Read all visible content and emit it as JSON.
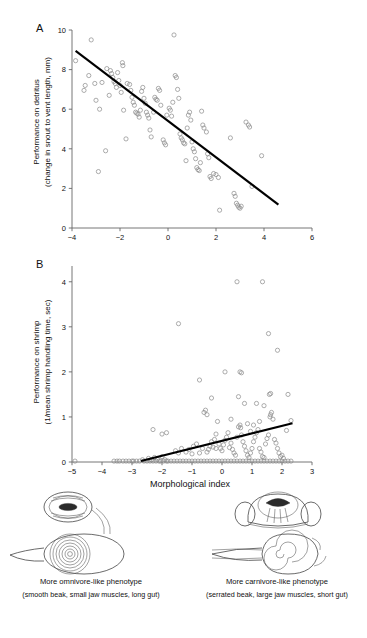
{
  "figure": {
    "panels": [
      {
        "id": "A",
        "label": "A",
        "ylabel_line1": "Performance on detritus",
        "ylabel_line2": "(change in snout to vent length, mm)"
      },
      {
        "id": "B",
        "label": "B",
        "ylabel_line1": "Performance on shrimp",
        "ylabel_line2": "(1/mean shrimp handling time, sec)",
        "xlabel": "Morphological index"
      }
    ],
    "morphs": [
      {
        "name": "omnivore",
        "caption_main": "More omnivore-like phenotype",
        "caption_sub": "(smooth beak, small jaw muscles, long gut)"
      },
      {
        "name": "carnivore",
        "caption_main": "More carnivore-like phenotype",
        "caption_sub": "(serrated beak, large jaw muscles, short gut)"
      }
    ]
  },
  "chart_data": [
    {
      "type": "scatter",
      "panel": "A",
      "title": "",
      "xlabel": "",
      "ylabel": "Performance on detritus (change in snout to vent length, mm)",
      "xlim": [
        -4,
        6
      ],
      "ylim": [
        0,
        10
      ],
      "xticks": [
        -4,
        -2,
        0,
        2,
        4,
        6
      ],
      "yticks": [
        0,
        2,
        4,
        6,
        8,
        10
      ],
      "xticklabels": [
        "−4",
        "−2",
        "0",
        "2",
        "4",
        "6"
      ],
      "yticklabels": [
        "0",
        "2",
        "4",
        "6",
        "8",
        "10"
      ],
      "grid": false,
      "legend": "none",
      "marker": "open-circle",
      "marker_color": "#8a8a8a",
      "trendline": {
        "type": "linear",
        "color": "#000000",
        "x": [
          -3.85,
          4.6
        ],
        "y": [
          8.95,
          1.18
        ]
      },
      "points": [
        [
          -3.85,
          8.45
        ],
        [
          -3.2,
          9.5
        ],
        [
          -3.3,
          7.7
        ],
        [
          -3.45,
          7.2
        ],
        [
          -3.05,
          7.3
        ],
        [
          -3.0,
          6.45
        ],
        [
          -3.5,
          6.95
        ],
        [
          -2.55,
          8.05
        ],
        [
          -2.4,
          7.95
        ],
        [
          -2.35,
          7.8
        ],
        [
          -2.3,
          7.6
        ],
        [
          -2.25,
          7.4
        ],
        [
          -2.2,
          7.3
        ],
        [
          -2.15,
          7.1
        ],
        [
          -2.1,
          7.85
        ],
        [
          -2.05,
          7.45
        ],
        [
          -2.0,
          7.2
        ],
        [
          -1.95,
          6.85
        ],
        [
          -1.9,
          8.35
        ],
        [
          -1.88,
          8.2
        ],
        [
          -1.7,
          7.3
        ],
        [
          -1.6,
          7.25
        ],
        [
          -1.55,
          6.95
        ],
        [
          -1.5,
          6.6
        ],
        [
          -1.45,
          6.35
        ],
        [
          -1.4,
          6.2
        ],
        [
          -1.35,
          5.85
        ],
        [
          -1.3,
          5.8
        ],
        [
          -1.25,
          5.75
        ],
        [
          -1.2,
          5.6
        ],
        [
          -1.15,
          5.95
        ],
        [
          -1.1,
          6.9
        ],
        [
          -1.05,
          7.1
        ],
        [
          -1.0,
          6.55
        ],
        [
          -0.95,
          6.3
        ],
        [
          -0.9,
          5.85
        ],
        [
          -0.85,
          5.7
        ],
        [
          -0.8,
          5.55
        ],
        [
          -0.75,
          4.95
        ],
        [
          -0.7,
          4.6
        ],
        [
          -0.6,
          5.85
        ],
        [
          -0.55,
          6.6
        ],
        [
          -0.5,
          6.5
        ],
        [
          -0.45,
          6.45
        ],
        [
          -0.4,
          7.05
        ],
        [
          -0.35,
          6.95
        ],
        [
          -0.3,
          6.2
        ],
        [
          -0.2,
          4.45
        ],
        [
          -0.15,
          4.3
        ],
        [
          -0.1,
          4.2
        ],
        [
          -2.85,
          6.0
        ],
        [
          -2.6,
          3.9
        ],
        [
          -2.9,
          2.85
        ],
        [
          -1.85,
          5.95
        ],
        [
          -1.75,
          4.5
        ],
        [
          0.05,
          6.05
        ],
        [
          0.1,
          5.95
        ],
        [
          0.15,
          5.65
        ],
        [
          0.2,
          6.35
        ],
        [
          0.3,
          7.7
        ],
        [
          0.35,
          7.6
        ],
        [
          0.4,
          7.0
        ],
        [
          0.45,
          6.55
        ],
        [
          0.5,
          4.75
        ],
        [
          0.55,
          4.55
        ],
        [
          0.6,
          4.45
        ],
        [
          0.65,
          4.3
        ],
        [
          0.7,
          4.25
        ],
        [
          0.75,
          3.4
        ],
        [
          0.8,
          5.05
        ],
        [
          0.85,
          5.7
        ],
        [
          0.9,
          5.85
        ],
        [
          1.0,
          4.35
        ],
        [
          1.05,
          4.0
        ],
        [
          1.1,
          3.85
        ],
        [
          1.15,
          3.5
        ],
        [
          1.2,
          3.05
        ],
        [
          1.25,
          2.95
        ],
        [
          1.3,
          2.9
        ],
        [
          1.35,
          3.3
        ],
        [
          1.4,
          5.9
        ],
        [
          1.45,
          5.2
        ],
        [
          1.5,
          5.05
        ],
        [
          1.6,
          4.85
        ],
        [
          1.65,
          3.75
        ],
        [
          1.7,
          3.55
        ],
        [
          1.75,
          2.6
        ],
        [
          1.8,
          2.5
        ],
        [
          1.9,
          2.75
        ],
        [
          2.0,
          2.7
        ],
        [
          2.1,
          2.55
        ],
        [
          2.15,
          0.9
        ],
        [
          2.6,
          4.55
        ],
        [
          2.75,
          1.75
        ],
        [
          2.8,
          1.6
        ],
        [
          2.85,
          1.25
        ],
        [
          2.9,
          1.15
        ],
        [
          2.95,
          1.05
        ],
        [
          3.0,
          1.0
        ],
        [
          3.05,
          1.1
        ],
        [
          3.25,
          5.35
        ],
        [
          3.35,
          5.2
        ],
        [
          3.4,
          5.1
        ],
        [
          3.9,
          3.65
        ],
        [
          3.5,
          2.1
        ],
        [
          0.25,
          9.75
        ],
        [
          -2.75,
          7.35
        ],
        [
          -2.45,
          6.7
        ],
        [
          -0.05,
          5.7
        ],
        [
          0.95,
          5.45
        ]
      ]
    },
    {
      "type": "scatter",
      "panel": "B",
      "title": "",
      "xlabel": "Morphological index",
      "ylabel": "Performance on shrimp (1/mean shrimp handling time, sec)",
      "xlim": [
        -5,
        3
      ],
      "ylim": [
        0,
        4.35
      ],
      "xticks": [
        -5,
        -4,
        -3,
        -2,
        -1,
        0,
        1,
        2,
        3
      ],
      "yticks": [
        0,
        1,
        2,
        3,
        4
      ],
      "xticklabels": [
        "−5",
        "−4",
        "−3",
        "−2",
        "−1",
        "0",
        "1",
        "2",
        "3"
      ],
      "yticklabels": [
        "0",
        "1",
        "2",
        "3",
        "4"
      ],
      "grid": false,
      "legend": "none",
      "marker": "open-circle",
      "marker_color": "#8a8a8a",
      "trendline": {
        "type": "linear",
        "color": "#000000",
        "x": [
          -2.7,
          2.35
        ],
        "y": [
          0.02,
          0.86
        ]
      },
      "points": [
        [
          -4.9,
          0.02
        ],
        [
          -3.6,
          0.02
        ],
        [
          -3.5,
          0.02
        ],
        [
          -3.42,
          0.02
        ],
        [
          -3.3,
          0.02
        ],
        [
          -3.2,
          0.02
        ],
        [
          -3.1,
          0.02
        ],
        [
          -3.0,
          0.02
        ],
        [
          -2.95,
          0.02
        ],
        [
          -2.85,
          0.02
        ],
        [
          -2.75,
          0.02
        ],
        [
          -2.65,
          0.05
        ],
        [
          -2.6,
          0.02
        ],
        [
          -2.5,
          0.02
        ],
        [
          -2.45,
          0.08
        ],
        [
          -2.4,
          0.02
        ],
        [
          -2.35,
          0.05
        ],
        [
          -2.3,
          0.02
        ],
        [
          -2.25,
          0.1
        ],
        [
          -2.2,
          0.02
        ],
        [
          -2.15,
          0.06
        ],
        [
          -2.1,
          0.02
        ],
        [
          -2.05,
          0.02
        ],
        [
          -2.0,
          0.12
        ],
        [
          -1.95,
          0.02
        ],
        [
          -1.9,
          0.05
        ],
        [
          -1.85,
          0.02
        ],
        [
          -1.8,
          0.02
        ],
        [
          -1.7,
          0.02
        ],
        [
          -1.6,
          0.02
        ],
        [
          -1.5,
          0.02
        ],
        [
          -1.4,
          0.02
        ],
        [
          -1.3,
          0.02
        ],
        [
          -1.2,
          0.02
        ],
        [
          -1.1,
          0.02
        ],
        [
          -1.0,
          0.02
        ],
        [
          -0.9,
          0.02
        ],
        [
          -0.8,
          0.02
        ],
        [
          -0.7,
          0.02
        ],
        [
          -0.6,
          0.02
        ],
        [
          -0.5,
          0.02
        ],
        [
          -0.4,
          0.02
        ],
        [
          -0.3,
          0.02
        ],
        [
          -0.2,
          0.02
        ],
        [
          -0.1,
          0.02
        ],
        [
          0.0,
          0.02
        ],
        [
          0.1,
          0.02
        ],
        [
          0.2,
          0.02
        ],
        [
          0.3,
          0.02
        ],
        [
          0.4,
          0.02
        ],
        [
          0.5,
          0.02
        ],
        [
          0.6,
          0.02
        ],
        [
          0.7,
          0.02
        ],
        [
          0.8,
          0.02
        ],
        [
          0.9,
          0.02
        ],
        [
          1.0,
          0.02
        ],
        [
          1.1,
          0.02
        ],
        [
          1.2,
          0.02
        ],
        [
          1.3,
          0.02
        ],
        [
          1.4,
          0.02
        ],
        [
          1.5,
          0.02
        ],
        [
          1.6,
          0.02
        ],
        [
          1.7,
          0.02
        ],
        [
          1.8,
          0.02
        ],
        [
          1.9,
          0.02
        ],
        [
          2.0,
          0.02
        ],
        [
          2.1,
          0.02
        ],
        [
          2.2,
          0.02
        ],
        [
          2.3,
          0.02
        ],
        [
          -2.3,
          0.72
        ],
        [
          -2.0,
          0.62
        ],
        [
          -1.85,
          0.65
        ],
        [
          -1.55,
          0.25
        ],
        [
          -1.45,
          0.2
        ],
        [
          -1.35,
          0.3
        ],
        [
          -1.2,
          0.22
        ],
        [
          -1.1,
          0.28
        ],
        [
          -1.0,
          0.18
        ],
        [
          -0.95,
          0.35
        ],
        [
          -0.85,
          0.4
        ],
        [
          -0.75,
          0.2
        ],
        [
          -0.65,
          0.3
        ],
        [
          -0.6,
          1.1
        ],
        [
          -0.55,
          1.15
        ],
        [
          -0.5,
          0.22
        ],
        [
          -0.45,
          0.28
        ],
        [
          -0.4,
          0.35
        ],
        [
          -0.35,
          0.45
        ],
        [
          -0.3,
          0.33
        ],
        [
          -0.25,
          0.5
        ],
        [
          -0.2,
          0.62
        ],
        [
          -0.15,
          0.9
        ],
        [
          -0.1,
          0.4
        ],
        [
          -0.05,
          0.3
        ],
        [
          0.0,
          0.25
        ],
        [
          0.05,
          0.38
        ],
        [
          0.1,
          0.48
        ],
        [
          0.15,
          0.55
        ],
        [
          0.2,
          0.65
        ],
        [
          0.25,
          0.32
        ],
        [
          0.3,
          0.42
        ],
        [
          0.35,
          0.28
        ],
        [
          0.4,
          0.2
        ],
        [
          0.45,
          0.15
        ],
        [
          0.5,
          0.55
        ],
        [
          0.55,
          0.78
        ],
        [
          0.6,
          0.82
        ],
        [
          0.62,
          0.76
        ],
        [
          0.65,
          0.6
        ],
        [
          0.7,
          0.45
        ],
        [
          0.75,
          0.35
        ],
        [
          0.8,
          0.25
        ],
        [
          0.85,
          0.15
        ],
        [
          0.9,
          0.1
        ],
        [
          0.95,
          0.2
        ],
        [
          1.0,
          0.3
        ],
        [
          1.05,
          0.45
        ],
        [
          1.1,
          0.55
        ],
        [
          1.15,
          0.65
        ],
        [
          1.2,
          0.72
        ],
        [
          1.25,
          0.3
        ],
        [
          1.3,
          0.22
        ],
        [
          1.35,
          0.12
        ],
        [
          1.4,
          0.1
        ],
        [
          1.45,
          0.4
        ],
        [
          1.5,
          0.52
        ],
        [
          1.55,
          0.6
        ],
        [
          1.6,
          1.0
        ],
        [
          1.62,
          1.05
        ],
        [
          1.65,
          1.1
        ],
        [
          1.7,
          0.95
        ],
        [
          1.75,
          0.5
        ],
        [
          1.8,
          0.42
        ],
        [
          1.85,
          0.3
        ],
        [
          1.9,
          0.2
        ],
        [
          1.95,
          0.12
        ],
        [
          2.0,
          0.15
        ],
        [
          2.05,
          0.08
        ],
        [
          2.15,
          0.7
        ],
        [
          2.3,
          0.92
        ],
        [
          2.2,
          1.5
        ],
        [
          1.58,
          1.5
        ],
        [
          1.62,
          1.52
        ],
        [
          1.4,
          1.25
        ],
        [
          1.15,
          1.3
        ],
        [
          0.75,
          1.3
        ],
        [
          0.55,
          1.45
        ],
        [
          -0.35,
          1.42
        ],
        [
          -0.5,
          1.05
        ],
        [
          -0.75,
          1.82
        ],
        [
          0.1,
          2.0
        ],
        [
          0.6,
          2.0
        ],
        [
          0.65,
          1.98
        ],
        [
          -1.45,
          3.07
        ],
        [
          0.5,
          4.0
        ],
        [
          1.35,
          4.0
        ],
        [
          1.55,
          2.85
        ],
        [
          1.85,
          2.48
        ],
        [
          0.3,
          0.95
        ],
        [
          0.85,
          0.85
        ],
        [
          1.05,
          0.82
        ],
        [
          -0.2,
          0.3
        ],
        [
          1.25,
          0.9
        ],
        [
          0.95,
          0.68
        ]
      ]
    }
  ]
}
